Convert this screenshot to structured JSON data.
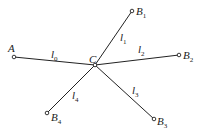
{
  "diagram": {
    "center": {
      "id": "C",
      "label": "C",
      "x": 95,
      "y": 65
    },
    "nodes": [
      {
        "id": "A",
        "label": "A",
        "sub": "",
        "x": 14,
        "y": 57,
        "lx": 8,
        "ly": 52
      },
      {
        "id": "B1",
        "label": "B",
        "sub": "1",
        "x": 132,
        "y": 11,
        "lx": 136,
        "ly": 15
      },
      {
        "id": "B2",
        "label": "B",
        "sub": "2",
        "x": 179,
        "y": 55,
        "lx": 183,
        "ly": 59
      },
      {
        "id": "B3",
        "label": "B",
        "sub": "3",
        "x": 154,
        "y": 119,
        "lx": 157,
        "ly": 125
      },
      {
        "id": "B4",
        "label": "B",
        "sub": "4",
        "x": 47,
        "y": 113,
        "lx": 51,
        "ly": 121
      }
    ],
    "edges": [
      {
        "id": "l0",
        "label": "l",
        "sub": "0",
        "from": "A",
        "lx": 51,
        "ly": 58
      },
      {
        "id": "l1",
        "label": "l",
        "sub": "1",
        "from": "B1",
        "lx": 120,
        "ly": 41
      },
      {
        "id": "l2",
        "label": "l",
        "sub": "2",
        "from": "B2",
        "lx": 138,
        "ly": 53
      },
      {
        "id": "l3",
        "label": "l",
        "sub": "3",
        "from": "B3",
        "lx": 132,
        "ly": 94
      },
      {
        "id": "l4",
        "label": "l",
        "sub": "4",
        "from": "B4",
        "lx": 72,
        "ly": 99
      }
    ],
    "center_label": {
      "text": "C",
      "lx": 89,
      "ly": 63
    }
  }
}
